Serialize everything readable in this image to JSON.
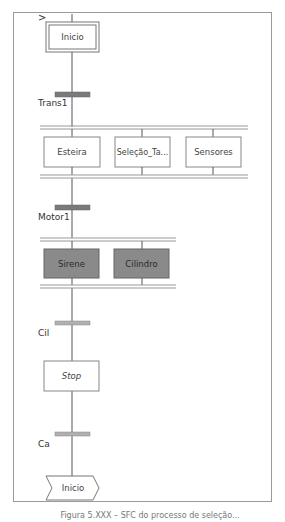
{
  "diagram": {
    "type": "SFC / Grafcet",
    "entry_marker": ">",
    "initial_step": {
      "label": "Inicio"
    },
    "transitions": [
      {
        "id": "t1",
        "label": "Trans1"
      },
      {
        "id": "t2",
        "label": "Motor1"
      },
      {
        "id": "t3",
        "label": "Cil"
      },
      {
        "id": "t4",
        "label": "Ca"
      }
    ],
    "parallel_branch_1": {
      "steps": [
        {
          "label": "Esteira"
        },
        {
          "label": "Seleção_Ta..."
        },
        {
          "label": "Sensores"
        }
      ]
    },
    "parallel_branch_2": {
      "steps": [
        {
          "label": "Sirene",
          "active": true
        },
        {
          "label": "Cilindro",
          "active": true
        }
      ]
    },
    "stop_step": {
      "label": "Stop"
    },
    "jump": {
      "label": "Inicio"
    },
    "caption": "Figura 5.XXX – SFC do processo de seleção..."
  },
  "colors": {
    "line": "#555555",
    "frame": "#9a9a9a",
    "transition_bar_dark": "#7a7a7a",
    "transition_bar_light": "#b0b0b0",
    "active_step_fill": "#8a8a8a",
    "step_border": "#7a7a7a"
  }
}
